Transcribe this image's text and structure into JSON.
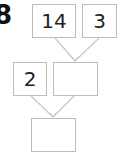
{
  "question_number": "8",
  "boxes": {
    "top_left": "14",
    "top_right": "3",
    "middle_left": "2",
    "middle_right": "",
    "bottom": ""
  },
  "colors": {
    "box_border": "#bdbdbd",
    "arrow": "#c8c8c8",
    "text": "#222222"
  }
}
